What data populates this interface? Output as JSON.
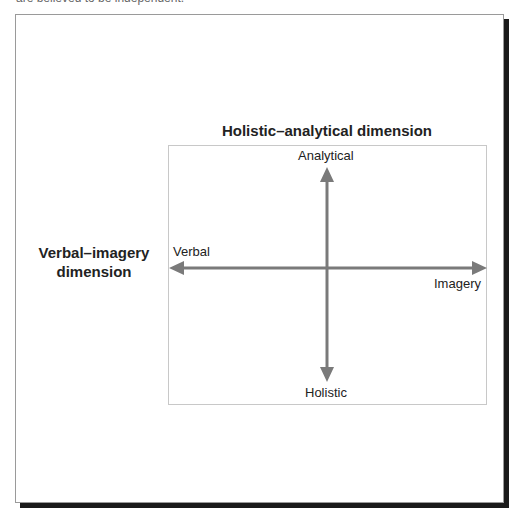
{
  "caption_fragment": "are believed to be independent.",
  "diagram": {
    "title_top": "Holistic–analytical dimension",
    "title_left": "Verbal–imagery dimension",
    "title_left_line1": "Verbal–imagery",
    "title_left_line2": "dimension",
    "vertical_axis": {
      "top_label": "Analytical",
      "bottom_label": "Holistic"
    },
    "horizontal_axis": {
      "left_label": "Verbal",
      "right_label": "Imagery"
    },
    "colors": {
      "axis": "#7a7a7a",
      "inner_border": "#c8c8c8",
      "frame_border": "#9a9a9a",
      "frame_shadow": "#1a1a1a",
      "text": "#222222"
    }
  }
}
